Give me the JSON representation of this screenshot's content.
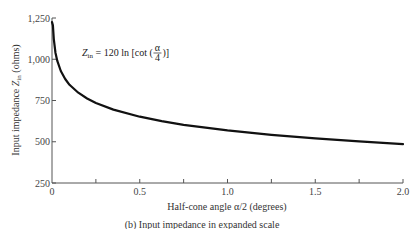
{
  "chart_data": {
    "type": "line",
    "title": "",
    "caption": "(b)  Input impedance in expanded scale",
    "xlabel": "Half-cone angle α/2 (degrees)",
    "ylabel": "Input impedance Z_in (ohms)",
    "ylabel_parts": {
      "main": "Input impedance ",
      "sym": "Z",
      "sub": "in",
      "unit": " (ohms)"
    },
    "annotation": {
      "lhs": "Z",
      "lhs_sub": "in",
      "rhs_pre": " = 120 ln [cot (",
      "frac_num": "α",
      "frac_den": "4",
      "rhs_post": ")]"
    },
    "xlim": [
      0,
      2.0
    ],
    "ylim": [
      250,
      1250
    ],
    "x_ticks": [
      0,
      0.25,
      0.5,
      0.75,
      1.0,
      1.25,
      1.5,
      1.75,
      2.0
    ],
    "x_tick_labels": [
      {
        "value": 0,
        "label": "0"
      },
      {
        "value": 0.5,
        "label": "0.5"
      },
      {
        "value": 1.0,
        "label": "1.0"
      },
      {
        "value": 1.5,
        "label": "1.5"
      },
      {
        "value": 2.0,
        "label": "2.0"
      }
    ],
    "y_ticks": [
      {
        "value": 250,
        "label": "250"
      },
      {
        "value": 500,
        "label": "500"
      },
      {
        "value": 750,
        "label": "750"
      },
      {
        "value": 1000,
        "label": "1,000"
      },
      {
        "value": 1250,
        "label": "1,250"
      }
    ],
    "grid": false,
    "legend": null,
    "series": [
      {
        "name": "Z_in = 120 ln[cot(α/4)]",
        "color": "#111111",
        "x": [
          0.005,
          0.01,
          0.02,
          0.03,
          0.05,
          0.075,
          0.1,
          0.15,
          0.2,
          0.25,
          0.35,
          0.5,
          0.625,
          0.75,
          0.875,
          1.0,
          1.25,
          1.5,
          1.75,
          2.0
        ],
        "values": [
          1205,
          1122,
          1038,
          990,
          929,
          880,
          845,
          797,
          762,
          735,
          695,
          652,
          625,
          603,
          585,
          569,
          542,
          520,
          502,
          486
        ]
      }
    ]
  }
}
